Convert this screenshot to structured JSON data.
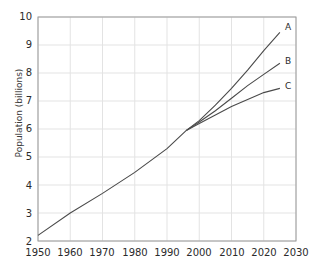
{
  "chart_data": {
    "type": "line",
    "title": "",
    "subtitle": "",
    "xlabel": "",
    "ylabel": "Population (billions)",
    "xlim": [
      1950,
      2030
    ],
    "ylim": [
      2,
      10
    ],
    "xticks": [
      1950,
      1960,
      1970,
      1980,
      1990,
      2000,
      2010,
      2020,
      2030
    ],
    "yticks": [
      2,
      3,
      4,
      5,
      6,
      7,
      8,
      9,
      10
    ],
    "grid": true,
    "legend_position": "inline-right-endpoint",
    "annotations": [
      {
        "text": "A",
        "x": 2025,
        "y": 9.45
      },
      {
        "text": "B",
        "x": 2025,
        "y": 8.35
      },
      {
        "text": "C",
        "x": 2025,
        "y": 7.45
      }
    ],
    "series": [
      {
        "name": "historical",
        "label": "",
        "color": "#4a4a4a",
        "x": [
          1950,
          1960,
          1970,
          1980,
          1990,
          1996
        ],
        "values": [
          2.2,
          3.0,
          3.7,
          4.45,
          5.3,
          5.95
        ]
      },
      {
        "name": "A",
        "label": "A",
        "color": "#4a4a4a",
        "x": [
          1996,
          2000,
          2005,
          2010,
          2015,
          2020,
          2025
        ],
        "values": [
          5.95,
          6.3,
          6.85,
          7.45,
          8.1,
          8.8,
          9.45
        ]
      },
      {
        "name": "B",
        "label": "B",
        "color": "#4a4a4a",
        "x": [
          1996,
          2000,
          2005,
          2010,
          2015,
          2020,
          2025
        ],
        "values": [
          5.95,
          6.25,
          6.65,
          7.1,
          7.55,
          7.95,
          8.35
        ]
      },
      {
        "name": "C",
        "label": "C",
        "color": "#4a4a4a",
        "x": [
          1996,
          2000,
          2005,
          2010,
          2015,
          2020,
          2025
        ],
        "values": [
          5.95,
          6.2,
          6.5,
          6.8,
          7.05,
          7.3,
          7.45
        ]
      }
    ]
  },
  "axis": {
    "y_title": "Population (billions)",
    "y_labels": [
      "10",
      "9",
      "8",
      "7",
      "6",
      "5",
      "4",
      "3",
      "2"
    ],
    "x_labels": [
      "1950",
      "1960",
      "1970",
      "1980",
      "1990",
      "2000",
      "2010",
      "2020",
      "2030"
    ]
  },
  "curve_labels": {
    "a": "A",
    "b": "B",
    "c": "C"
  },
  "colors": {
    "line": "#4a4a4a",
    "grid": "#e3e3e3",
    "frame": "#9a9a9a",
    "text": "#2b2b2b",
    "background": "#ffffff"
  }
}
